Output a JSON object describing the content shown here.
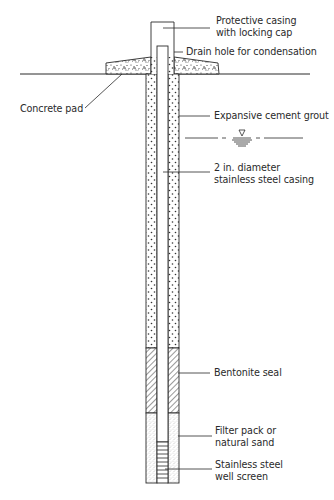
{
  "diagram": {
    "colors": {
      "line": "#2a2a2a",
      "background": "#ffffff",
      "fill_dots": "#3a3a3a"
    },
    "labels": {
      "protective_casing": [
        "Protective casing",
        "with locking cap"
      ],
      "drain_hole": "Drain hole for condensation",
      "concrete_pad": "Concrete pad",
      "cement_grout": "Expansive cement grout",
      "steel_casing": [
        "2 in. diameter",
        "stainless steel casing"
      ],
      "bentonite_seal": "Bentonite seal",
      "filter_pack": [
        "Filter pack or",
        "natural sand"
      ],
      "well_screen": [
        "Stainless steel",
        "well screen"
      ]
    },
    "symbols": {
      "water_table": "water-table-symbol"
    }
  }
}
